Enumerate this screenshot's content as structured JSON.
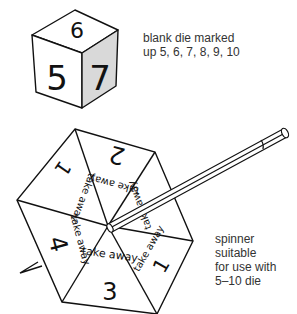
{
  "die": {
    "faces": {
      "top": "9",
      "front": "5",
      "side": "7"
    },
    "caption": [
      "blank die marked",
      "up 5, 6, 7, 8, 9, 10"
    ]
  },
  "spinner": {
    "sectors": [
      {
        "number": "2",
        "label": "take away"
      },
      {
        "number": "1",
        "label": "take away"
      },
      {
        "number": "4",
        "label": "take away"
      },
      {
        "number": "3",
        "label": "take away"
      },
      {
        "number": "1",
        "label": "take away"
      },
      {
        "number": "",
        "label": "take away"
      }
    ],
    "caption": [
      "spinner",
      "suitable",
      "for use with",
      "5–10 die"
    ]
  },
  "colors": {
    "line": "#111111",
    "shade": "#d9d9d9",
    "text": "#333333"
  }
}
